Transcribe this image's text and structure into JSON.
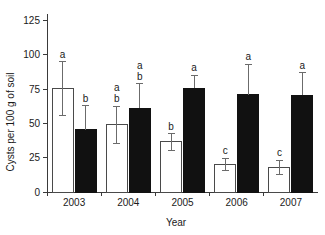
{
  "chart_data": {
    "type": "bar",
    "title": "",
    "xlabel": "Year",
    "ylabel": "Cysts per 100 g of soil",
    "categories": [
      "2003",
      "2004",
      "2005",
      "2006",
      "2007"
    ],
    "ylim": [
      0,
      132
    ],
    "yticks": [
      0,
      25,
      50,
      75,
      100,
      125
    ],
    "ytick_labels": [
      "0",
      "25",
      "50",
      "75",
      "100",
      "125"
    ],
    "grid": false,
    "legend": "none",
    "series": [
      {
        "name": "open",
        "fill": "#ffffff",
        "edge": "#4a4a4a",
        "values": [
          75.5,
          49.0,
          36.5,
          20.0,
          18.0
        ],
        "err_upper": [
          95.0,
          62.5,
          42.5,
          24.5,
          23.0
        ],
        "err_lower": [
          56.0,
          35.5,
          30.5,
          15.5,
          13.0
        ],
        "annotations": [
          "a",
          "a\nb",
          "b",
          "c",
          "c"
        ]
      },
      {
        "name": "filled",
        "fill": "#111111",
        "edge": "#111111",
        "values": [
          45.5,
          61.0,
          75.5,
          71.0,
          70.5
        ],
        "err_upper": [
          63.0,
          79.0,
          85.0,
          93.0,
          87.0
        ],
        "err_lower": [
          45.5,
          61.0,
          75.5,
          71.0,
          70.5
        ],
        "annotations": [
          "b",
          "a\nb",
          "a",
          "a",
          "a"
        ]
      }
    ]
  },
  "colors": {
    "axis": "#3a3a3a",
    "text": "#1a1a1a",
    "error": "#6b6b6b",
    "open_bar": "#ffffff",
    "filled_bar": "#111111",
    "background": "#ffffff"
  }
}
